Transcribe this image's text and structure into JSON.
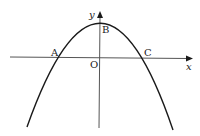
{
  "diagram": {
    "type": "parabola-graph",
    "axes": {
      "x_label": "x",
      "y_label": "y",
      "origin_label": "O"
    },
    "points": {
      "A": "A",
      "B": "B",
      "C": "C"
    },
    "colors": {
      "curve": "#1a1a1a",
      "axis": "#555555",
      "background": "#ffffff"
    }
  }
}
